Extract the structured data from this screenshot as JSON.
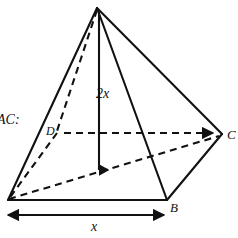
{
  "figure": {
    "kind": "square-pyramid-diagram",
    "background_color": "#ffffff",
    "line_color": "#111111",
    "prompt_text": "AC:",
    "vertices": {
      "apex": {
        "name": "apex",
        "x": 97,
        "y": 8
      },
      "A": {
        "name": "A",
        "x": 8,
        "y": 200
      },
      "B": {
        "name": "B",
        "x": 167,
        "y": 200
      },
      "C": {
        "name": "C",
        "x": 222,
        "y": 134
      },
      "D": {
        "name": "D",
        "x": 57,
        "y": 133
      },
      "center": {
        "name": "base-center",
        "x": 99,
        "y": 172
      }
    },
    "labels": {
      "prompt": "AC:",
      "vertex_d": "D",
      "vertex_c": "C",
      "vertex_b": "B",
      "height": "2x",
      "base_width": "x"
    },
    "edges": [
      {
        "name": "apex-to-A",
        "style": "solid",
        "from": "apex",
        "to": "A"
      },
      {
        "name": "apex-to-B",
        "style": "solid",
        "from": "apex",
        "to": "B"
      },
      {
        "name": "apex-to-C",
        "style": "solid",
        "from": "apex",
        "to": "C"
      },
      {
        "name": "apex-to-D",
        "style": "dashed",
        "from": "apex",
        "to": "D"
      },
      {
        "name": "base-A-to-B",
        "style": "solid",
        "from": "A",
        "to": "B"
      },
      {
        "name": "base-B-to-C",
        "style": "solid",
        "from": "B",
        "to": "C"
      },
      {
        "name": "base-C-to-D",
        "style": "dashed",
        "from": "C",
        "to": "D"
      },
      {
        "name": "base-D-to-A",
        "style": "dashed",
        "from": "D",
        "to": "A"
      },
      {
        "name": "diagonal-A-to-C",
        "style": "dashed",
        "from": "A",
        "to": "C"
      }
    ],
    "dimensions": [
      {
        "name": "height-dimension",
        "label": "2x",
        "style": "arrow-down",
        "from_x": 99,
        "from_y": 12,
        "to_x": 99,
        "to_y": 172
      },
      {
        "name": "base-width-dimension",
        "label": "x",
        "style": "double-arrow",
        "from_x": 6,
        "from_y": 215,
        "to_x": 166,
        "to_y": 215
      }
    ]
  }
}
